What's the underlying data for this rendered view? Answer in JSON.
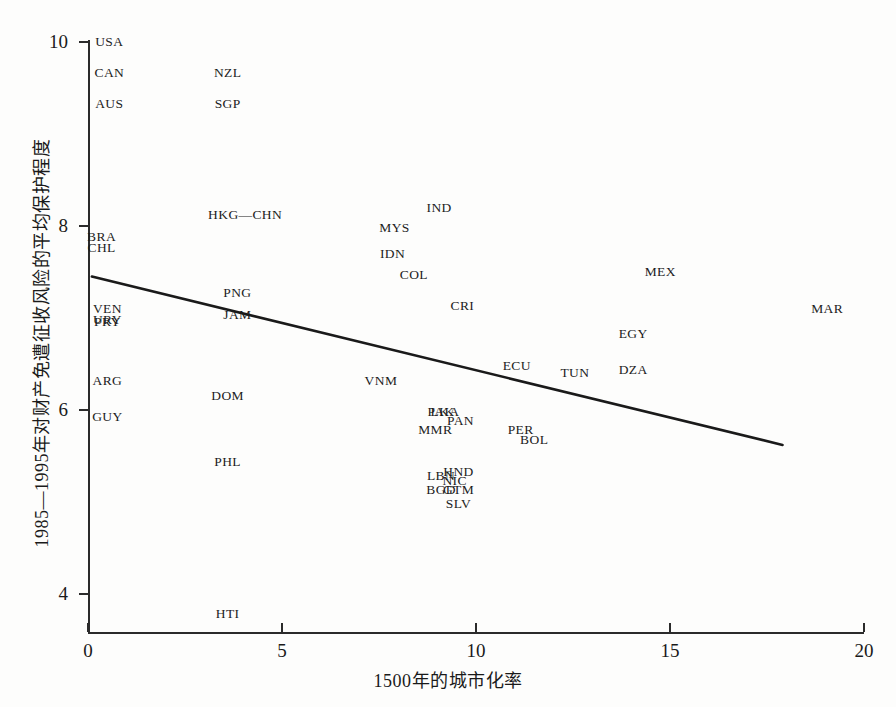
{
  "chart_data": {
    "type": "scatter",
    "title": "",
    "xlabel": "1500年的城市化率",
    "ylabel": "1985—1995年对财产免遭征收风险的平均保护程度",
    "xlim": [
      0,
      20
    ],
    "ylim": [
      3.6,
      10.2
    ],
    "xticks": [
      0,
      5,
      10,
      15,
      20
    ],
    "yticks": [
      4,
      6,
      8,
      10
    ],
    "xtick_labels": [
      "0",
      "5",
      "10",
      "15",
      "20"
    ],
    "ytick_labels": [
      "4",
      "6",
      "8",
      "10"
    ],
    "grid": false,
    "legend": "none",
    "point_marker": "text-label-only",
    "trendline": {
      "type": "linear-fit",
      "x_start": 0.1,
      "y_start": 7.45,
      "x_end": 17.9,
      "y_end": 5.62,
      "slope": -0.103,
      "intercept": 7.46,
      "color": "#1a1a1a"
    },
    "points": [
      {
        "label": "USA",
        "x": 0.55,
        "y": 10.0
      },
      {
        "label": "CAN",
        "x": 0.55,
        "y": 9.66
      },
      {
        "label": "NZL",
        "x": 3.6,
        "y": 9.66
      },
      {
        "label": "AUS",
        "x": 0.55,
        "y": 9.33
      },
      {
        "label": "SGP",
        "x": 3.6,
        "y": 9.33
      },
      {
        "label": "IND",
        "x": 9.05,
        "y": 8.2
      },
      {
        "label": "HKG—CHN",
        "x": 4.05,
        "y": 8.12
      },
      {
        "label": "MYS",
        "x": 7.9,
        "y": 7.98
      },
      {
        "label": "BRA",
        "x": 0.35,
        "y": 7.88
      },
      {
        "label": "CHL",
        "x": 0.35,
        "y": 7.76
      },
      {
        "label": "IDN",
        "x": 7.85,
        "y": 7.7
      },
      {
        "label": "MEX",
        "x": 14.75,
        "y": 7.5
      },
      {
        "label": "COL",
        "x": 8.4,
        "y": 7.47
      },
      {
        "label": "PNG",
        "x": 3.85,
        "y": 7.27
      },
      {
        "label": "VEN",
        "x": 0.5,
        "y": 7.1
      },
      {
        "label": "MAR",
        "x": 19.05,
        "y": 7.1
      },
      {
        "label": "CRI",
        "x": 9.65,
        "y": 7.13
      },
      {
        "label": "JAM",
        "x": 3.85,
        "y": 7.03
      },
      {
        "label": "URY",
        "x": 0.5,
        "y": 6.98
      },
      {
        "label": "PRY",
        "x": 0.5,
        "y": 6.96
      },
      {
        "label": "EGY",
        "x": 14.05,
        "y": 6.83
      },
      {
        "label": "ECU",
        "x": 11.05,
        "y": 6.48
      },
      {
        "label": "TUN",
        "x": 12.55,
        "y": 6.4
      },
      {
        "label": "DZA",
        "x": 14.05,
        "y": 6.43
      },
      {
        "label": "ARG",
        "x": 0.5,
        "y": 6.32
      },
      {
        "label": "VNM",
        "x": 7.55,
        "y": 6.32
      },
      {
        "label": "DOM",
        "x": 3.6,
        "y": 6.15
      },
      {
        "label": "PAK",
        "x": 9.1,
        "y": 5.98
      },
      {
        "label": "LKA",
        "x": 9.2,
        "y": 5.98
      },
      {
        "label": "PAN",
        "x": 9.6,
        "y": 5.88
      },
      {
        "label": "GUY",
        "x": 0.5,
        "y": 5.92
      },
      {
        "label": "MMR",
        "x": 8.95,
        "y": 5.78
      },
      {
        "label": "PER",
        "x": 11.15,
        "y": 5.78
      },
      {
        "label": "BOL",
        "x": 11.5,
        "y": 5.67
      },
      {
        "label": "PHL",
        "x": 3.6,
        "y": 5.43
      },
      {
        "label": "HND",
        "x": 9.55,
        "y": 5.33
      },
      {
        "label": "LBN",
        "x": 9.1,
        "y": 5.28
      },
      {
        "label": "NIC",
        "x": 9.45,
        "y": 5.23
      },
      {
        "label": "BGD",
        "x": 9.1,
        "y": 5.13
      },
      {
        "label": "GTM",
        "x": 9.55,
        "y": 5.13
      },
      {
        "label": "SLV",
        "x": 9.55,
        "y": 4.98
      },
      {
        "label": "HTI",
        "x": 3.6,
        "y": 3.78
      }
    ]
  },
  "figure": {
    "background_color": "#fdfdfc",
    "axis_color": "#2b2b2b",
    "text_color": "#1a1a1a"
  }
}
